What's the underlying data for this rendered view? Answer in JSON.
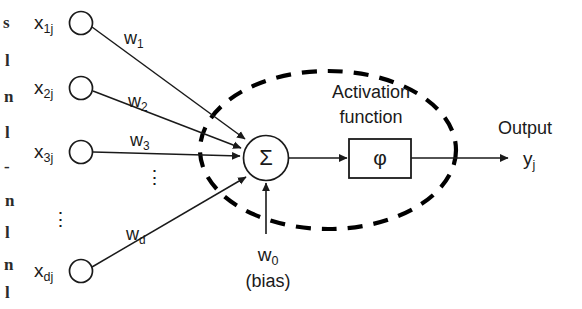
{
  "diagram": {
    "colors": {
      "ink": "#1a1a1a",
      "background": "#ffffff",
      "dashed_boundary": "#000000"
    },
    "inputs": [
      {
        "label_base": "x",
        "label_sub": "1j",
        "weight_base": "w",
        "weight_sub": "1"
      },
      {
        "label_base": "x",
        "label_sub": "2j",
        "weight_base": "w",
        "weight_sub": "2"
      },
      {
        "label_base": "x",
        "label_sub": "3j",
        "weight_base": "w",
        "weight_sub": "3"
      },
      {
        "label_base": "x",
        "label_sub": "dj",
        "weight_base": "w",
        "weight_sub": "d"
      }
    ],
    "ellipsis_glyph": "⋮",
    "summation": {
      "symbol": "Σ",
      "name": "summation-junction"
    },
    "bias": {
      "label_base": "w",
      "label_sub": "0",
      "caption": "(bias)"
    },
    "activation": {
      "caption_line1": "Activation",
      "caption_line2": "function",
      "symbol": "φ"
    },
    "output": {
      "caption": "Output",
      "label_base": "y",
      "label_sub": "j"
    },
    "page_edge_fragments": [
      "s",
      "l",
      "n",
      "l",
      "-",
      "n",
      "l",
      "n",
      "l"
    ]
  }
}
